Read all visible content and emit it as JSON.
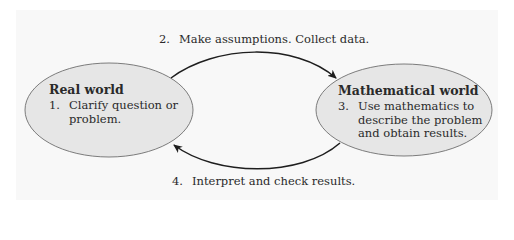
{
  "diagram": {
    "nodes": [
      {
        "id": "real-world",
        "title": "Real world",
        "step_number": "1.",
        "lines": [
          "Clarify question or",
          "problem."
        ]
      },
      {
        "id": "mathematical-world",
        "title": "Mathematical world",
        "step_number": "3.",
        "lines": [
          "Use mathematics to",
          "describe the problem",
          "and obtain results."
        ]
      }
    ],
    "edges": [
      {
        "from": "real-world",
        "to": "mathematical-world",
        "step_number": "2.",
        "label": "Make assumptions. Collect data."
      },
      {
        "from": "mathematical-world",
        "to": "real-world",
        "step_number": "4.",
        "label": "Interpret and check results."
      }
    ],
    "colors": {
      "node_fill": "#e6e6e6",
      "node_stroke": "#6e6e6e",
      "arrow": "#1e1e1e",
      "background_panel": "#f8f8f8"
    }
  }
}
